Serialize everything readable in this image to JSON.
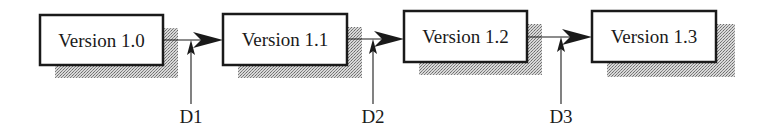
{
  "diagram": {
    "type": "version-flow",
    "colors": {
      "stroke": "#1a1a1a",
      "box_fill": "#ffffff",
      "shadow": "#9a9a9a"
    },
    "versions": [
      {
        "label": "Version 1.0",
        "x": 40,
        "y": 15,
        "w": 123,
        "h": 50
      },
      {
        "label": "Version 1.1",
        "x": 223,
        "y": 14,
        "w": 124,
        "h": 51
      },
      {
        "label": "Version 1.2",
        "x": 404,
        "y": 11,
        "w": 123,
        "h": 51
      },
      {
        "label": "Version 1.3",
        "x": 592,
        "y": 11,
        "w": 124,
        "h": 51
      }
    ],
    "deltas": [
      {
        "label": "D1",
        "x": 191,
        "line_y": 40
      },
      {
        "label": "D2",
        "x": 373,
        "line_y": 39
      },
      {
        "label": "D3",
        "x": 561,
        "line_y": 37
      }
    ]
  }
}
